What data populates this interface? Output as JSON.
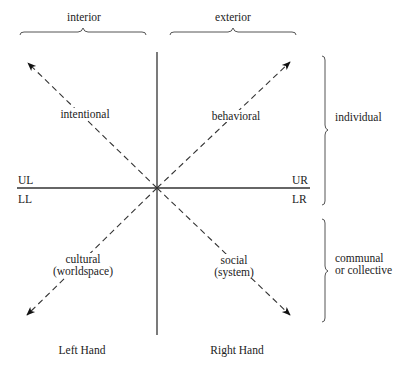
{
  "diagram": {
    "type": "four-quadrant",
    "top_labels": {
      "left": "interior",
      "right": "exterior"
    },
    "right_labels": {
      "top": "individual",
      "bottom_line1": "communal",
      "bottom_line2": "or collective"
    },
    "quadrant_codes": {
      "ul": "UL",
      "ur": "UR",
      "ll": "LL",
      "lr": "LR"
    },
    "quadrants": {
      "ul": {
        "label": "intentional"
      },
      "ur": {
        "label": "behavioral"
      },
      "ll": {
        "label_line1": "cultural",
        "label_line2": "(worldspace)"
      },
      "lr": {
        "label_line1": "social",
        "label_line2": "(system)"
      }
    },
    "bottom_labels": {
      "left": "Left Hand",
      "right": "Right Hand"
    },
    "colors": {
      "line": "#333333",
      "text": "#222222",
      "background": "#ffffff"
    }
  }
}
